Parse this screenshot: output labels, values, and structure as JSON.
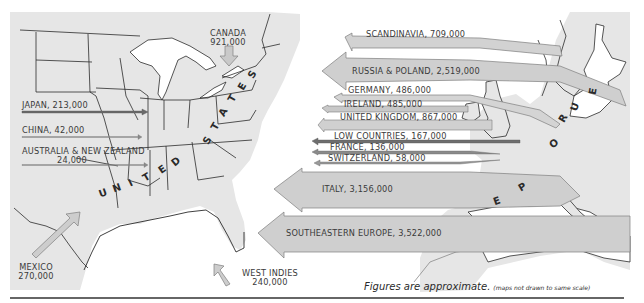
{
  "map": {
    "colors": {
      "land": "#e6e6e6",
      "water": "#ffffff",
      "border": "#2b2b2b",
      "arrow_fill": "#cfcfcf",
      "arrow_dark": "#7a7a7a",
      "arrow_stroke": "#8a8a8a",
      "rule": "#666666"
    },
    "inbound_flows": [
      {
        "label": "CANADA",
        "value": "921,000"
      },
      {
        "label": "JAPAN, 213,000"
      },
      {
        "label": "CHINA, 42,000"
      },
      {
        "label": "AUSTRALIA & NEW ZEALAND",
        "value": "24,000"
      },
      {
        "label": "MEXICO",
        "value": "270,000"
      },
      {
        "label": "WEST INDIES",
        "value": "240,000"
      }
    ],
    "european_flows": [
      {
        "label": "SCANDINAVIA, 709,000"
      },
      {
        "label": "RUSSIA & POLAND, 2,519,000"
      },
      {
        "label": "GERMANY, 486,000"
      },
      {
        "label": "IRELAND, 485,000"
      },
      {
        "label": "UNITED KINGDOM, 867,000"
      },
      {
        "label": "LOW COUNTRIES, 167,000"
      },
      {
        "label": "FRANCE, 136,000"
      },
      {
        "label": "SWITZERLAND, 58,000"
      },
      {
        "label": "ITALY, 3,156,000"
      },
      {
        "label": "SOUTHEASTERN EUROPE, 3,522,000"
      }
    ],
    "region_letters": {
      "united_states": [
        "U",
        "N",
        "I",
        "T",
        "E",
        "D",
        "S",
        "T",
        "A",
        "T",
        "E",
        "S"
      ],
      "europe": [
        "E",
        "U",
        "R",
        "O",
        "P",
        "E"
      ]
    },
    "note": {
      "main": "Figures are approximate.",
      "sub": "(maps not drawn to same scale)"
    }
  }
}
